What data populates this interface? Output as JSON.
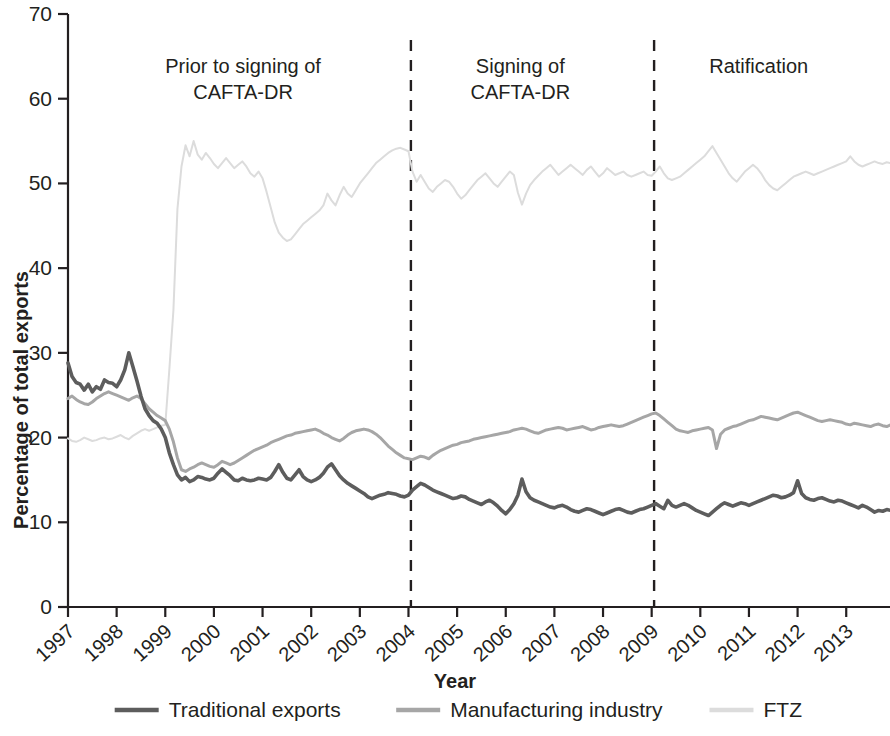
{
  "chart_data": {
    "type": "line",
    "title": "",
    "xlabel": "Year",
    "ylabel": "Percentage of total exports",
    "xlim": [
      1997.0,
      2013.9
    ],
    "ylim": [
      0,
      70
    ],
    "yticks": [
      0,
      10,
      20,
      30,
      40,
      50,
      60,
      70
    ],
    "xticks": [
      1997,
      1998,
      1999,
      2000,
      2001,
      2002,
      2003,
      2004,
      2005,
      2006,
      2007,
      2008,
      2009,
      2010,
      2011,
      2012,
      2013
    ],
    "grid": false,
    "legend_position": "bottom",
    "annotations": [
      {
        "name": "prior-to-signing",
        "lines": [
          "Prior to signing of",
          "CAFTA-DR"
        ],
        "x": 2000.6,
        "y": 63
      },
      {
        "name": "signing",
        "lines": [
          "Signing of",
          "CAFTA-DR"
        ],
        "x": 2006.3,
        "y": 63
      },
      {
        "name": "ratification",
        "lines": [
          "Ratification"
        ],
        "x": 2011.2,
        "y": 63
      }
    ],
    "vertical_dividers": [
      {
        "name": "signing-divider",
        "x": 2004.05,
        "label": "Signing of CAFTA-DR"
      },
      {
        "name": "ratification-divider",
        "x": 2009.05,
        "label": "Ratification"
      }
    ],
    "colors": {
      "traditional": "#5d5d5d",
      "manufacturing": "#a6a6a6",
      "ftz": "#dcdcdc",
      "axis": "#231f20"
    },
    "x": [
      1997.0,
      1997.083,
      1997.167,
      1997.25,
      1997.333,
      1997.417,
      1997.5,
      1997.583,
      1997.667,
      1997.75,
      1997.833,
      1997.917,
      1998.0,
      1998.083,
      1998.167,
      1998.25,
      1998.333,
      1998.417,
      1998.5,
      1998.583,
      1998.667,
      1998.75,
      1998.833,
      1998.917,
      1999.0,
      1999.083,
      1999.167,
      1999.25,
      1999.333,
      1999.417,
      1999.5,
      1999.583,
      1999.667,
      1999.75,
      1999.833,
      1999.917,
      2000.0,
      2000.083,
      2000.167,
      2000.25,
      2000.333,
      2000.417,
      2000.5,
      2000.583,
      2000.667,
      2000.75,
      2000.833,
      2000.917,
      2001.0,
      2001.083,
      2001.167,
      2001.25,
      2001.333,
      2001.417,
      2001.5,
      2001.583,
      2001.667,
      2001.75,
      2001.833,
      2001.917,
      2002.0,
      2002.083,
      2002.167,
      2002.25,
      2002.333,
      2002.417,
      2002.5,
      2002.583,
      2002.667,
      2002.75,
      2002.833,
      2002.917,
      2003.0,
      2003.083,
      2003.167,
      2003.25,
      2003.333,
      2003.417,
      2003.5,
      2003.583,
      2003.667,
      2003.75,
      2003.833,
      2003.917,
      2004.0,
      2004.083,
      2004.167,
      2004.25,
      2004.333,
      2004.417,
      2004.5,
      2004.583,
      2004.667,
      2004.75,
      2004.833,
      2004.917,
      2005.0,
      2005.083,
      2005.167,
      2005.25,
      2005.333,
      2005.417,
      2005.5,
      2005.583,
      2005.667,
      2005.75,
      2005.833,
      2005.917,
      2006.0,
      2006.083,
      2006.167,
      2006.25,
      2006.333,
      2006.417,
      2006.5,
      2006.583,
      2006.667,
      2006.75,
      2006.833,
      2006.917,
      2007.0,
      2007.083,
      2007.167,
      2007.25,
      2007.333,
      2007.417,
      2007.5,
      2007.583,
      2007.667,
      2007.75,
      2007.833,
      2007.917,
      2008.0,
      2008.083,
      2008.167,
      2008.25,
      2008.333,
      2008.417,
      2008.5,
      2008.583,
      2008.667,
      2008.75,
      2008.833,
      2008.917,
      2009.0,
      2009.083,
      2009.167,
      2009.25,
      2009.333,
      2009.417,
      2009.5,
      2009.583,
      2009.667,
      2009.75,
      2009.833,
      2009.917,
      2010.0,
      2010.083,
      2010.167,
      2010.25,
      2010.333,
      2010.417,
      2010.5,
      2010.583,
      2010.667,
      2010.75,
      2010.833,
      2010.917,
      2011.0,
      2011.083,
      2011.167,
      2011.25,
      2011.333,
      2011.417,
      2011.5,
      2011.583,
      2011.667,
      2011.75,
      2011.833,
      2011.917,
      2012.0,
      2012.083,
      2012.167,
      2012.25,
      2012.333,
      2012.417,
      2012.5,
      2012.583,
      2012.667,
      2012.75,
      2012.833,
      2012.917,
      2013.0,
      2013.083,
      2013.167,
      2013.25,
      2013.333,
      2013.417,
      2013.5,
      2013.583,
      2013.667,
      2013.75,
      2013.833,
      2013.917
    ],
    "series": [
      {
        "name": "Traditional exports",
        "color": "#5d5d5d",
        "values": [
          28.8,
          27.2,
          26.5,
          26.3,
          25.6,
          26.3,
          25.4,
          26.0,
          25.7,
          26.8,
          26.5,
          26.4,
          26.0,
          26.8,
          28.0,
          30.0,
          28.4,
          26.7,
          24.9,
          23.4,
          22.6,
          22.0,
          21.7,
          21.0,
          20.0,
          18.2,
          16.8,
          15.6,
          15.0,
          15.3,
          14.8,
          15.0,
          15.4,
          15.3,
          15.1,
          15.0,
          15.2,
          15.8,
          16.3,
          15.9,
          15.5,
          15.0,
          14.9,
          15.2,
          15.0,
          14.9,
          15.0,
          15.2,
          15.1,
          15.0,
          15.3,
          16.0,
          16.8,
          15.9,
          15.2,
          15.0,
          15.6,
          16.2,
          15.4,
          15.0,
          14.8,
          15.0,
          15.3,
          15.8,
          16.5,
          16.9,
          16.2,
          15.5,
          15.0,
          14.6,
          14.3,
          14.0,
          13.7,
          13.4,
          13.0,
          12.8,
          13.0,
          13.2,
          13.3,
          13.5,
          13.4,
          13.3,
          13.1,
          13.0,
          13.2,
          13.8,
          14.2,
          14.6,
          14.4,
          14.1,
          13.8,
          13.6,
          13.4,
          13.2,
          13.0,
          12.8,
          12.9,
          13.1,
          13.0,
          12.7,
          12.5,
          12.3,
          12.1,
          12.4,
          12.6,
          12.3,
          11.9,
          11.4,
          11.0,
          11.5,
          12.2,
          13.2,
          15.1,
          13.6,
          12.9,
          12.6,
          12.4,
          12.2,
          12.0,
          11.8,
          11.7,
          11.9,
          12.0,
          11.8,
          11.5,
          11.3,
          11.2,
          11.4,
          11.6,
          11.5,
          11.3,
          11.1,
          10.9,
          11.1,
          11.3,
          11.5,
          11.6,
          11.4,
          11.2,
          11.1,
          11.3,
          11.5,
          11.6,
          11.8,
          12.0,
          12.2,
          11.9,
          11.6,
          12.6,
          12.0,
          11.8,
          12.0,
          12.2,
          12.0,
          11.7,
          11.4,
          11.2,
          11.0,
          10.8,
          11.2,
          11.6,
          12.0,
          12.3,
          12.1,
          11.9,
          12.1,
          12.3,
          12.2,
          12.0,
          12.2,
          12.4,
          12.6,
          12.8,
          13.0,
          13.2,
          13.1,
          12.9,
          13.0,
          13.2,
          13.5,
          14.9,
          13.4,
          12.9,
          12.7,
          12.6,
          12.8,
          12.9,
          12.7,
          12.5,
          12.4,
          12.6,
          12.5,
          12.3,
          12.1,
          11.9,
          11.7,
          12.0,
          11.8,
          11.5,
          11.2,
          11.4,
          11.3,
          11.5,
          11.4
        ]
      },
      {
        "name": "Manufacturing industry",
        "color": "#a6a6a6",
        "values": [
          24.6,
          24.9,
          24.5,
          24.2,
          24.0,
          23.9,
          24.2,
          24.6,
          24.9,
          25.2,
          25.4,
          25.2,
          25.0,
          24.8,
          24.6,
          24.4,
          24.7,
          24.9,
          24.6,
          24.0,
          23.4,
          23.0,
          22.6,
          22.3,
          22.0,
          21.0,
          19.5,
          17.6,
          16.2,
          16.0,
          16.3,
          16.5,
          16.8,
          17.0,
          16.8,
          16.6,
          16.5,
          16.8,
          17.2,
          17.0,
          16.8,
          17.0,
          17.3,
          17.6,
          17.9,
          18.2,
          18.5,
          18.7,
          18.9,
          19.1,
          19.4,
          19.6,
          19.8,
          20.0,
          20.2,
          20.3,
          20.5,
          20.6,
          20.7,
          20.8,
          20.9,
          21.0,
          20.8,
          20.5,
          20.3,
          20.0,
          19.8,
          19.6,
          19.9,
          20.3,
          20.6,
          20.8,
          20.9,
          21.0,
          20.9,
          20.7,
          20.4,
          20.0,
          19.5,
          19.0,
          18.6,
          18.2,
          17.9,
          17.6,
          17.5,
          17.4,
          17.6,
          17.8,
          17.7,
          17.5,
          17.9,
          18.2,
          18.5,
          18.7,
          18.9,
          19.1,
          19.2,
          19.4,
          19.5,
          19.6,
          19.8,
          19.9,
          20.0,
          20.1,
          20.2,
          20.3,
          20.4,
          20.5,
          20.6,
          20.7,
          20.9,
          21.0,
          21.1,
          21.0,
          20.8,
          20.6,
          20.5,
          20.7,
          20.9,
          21.0,
          21.1,
          21.2,
          21.1,
          20.9,
          21.0,
          21.1,
          21.2,
          21.3,
          21.1,
          20.9,
          21.0,
          21.2,
          21.3,
          21.4,
          21.5,
          21.4,
          21.3,
          21.4,
          21.6,
          21.8,
          22.0,
          22.2,
          22.4,
          22.6,
          22.8,
          22.9,
          22.6,
          22.2,
          21.8,
          21.4,
          21.0,
          20.8,
          20.7,
          20.6,
          20.8,
          20.9,
          21.0,
          21.1,
          21.2,
          20.9,
          18.7,
          20.4,
          20.9,
          21.1,
          21.3,
          21.4,
          21.6,
          21.8,
          22.0,
          22.1,
          22.3,
          22.5,
          22.4,
          22.3,
          22.2,
          22.1,
          22.3,
          22.5,
          22.7,
          22.9,
          23.0,
          22.8,
          22.6,
          22.4,
          22.2,
          22.0,
          21.9,
          22.0,
          22.1,
          22.0,
          21.9,
          21.8,
          21.6,
          21.5,
          21.7,
          21.6,
          21.5,
          21.4,
          21.3,
          21.5,
          21.6,
          21.4,
          21.3,
          21.5
        ]
      },
      {
        "name": "FTZ",
        "color": "#dcdcdc",
        "values": [
          19.9,
          19.6,
          19.5,
          19.7,
          20.0,
          19.8,
          19.6,
          19.7,
          19.9,
          20.0,
          19.8,
          19.9,
          20.1,
          20.3,
          20.0,
          19.8,
          20.2,
          20.5,
          20.8,
          21.0,
          20.8,
          21.0,
          21.2,
          21.4,
          21.5,
          28.0,
          35.0,
          47.0,
          52.0,
          54.5,
          53.2,
          55.0,
          53.4,
          52.8,
          53.6,
          53.0,
          52.3,
          51.8,
          52.4,
          53.0,
          52.4,
          51.8,
          52.2,
          52.6,
          52.0,
          51.2,
          50.8,
          51.4,
          50.6,
          49.0,
          47.2,
          45.4,
          44.2,
          43.6,
          43.2,
          43.4,
          44.0,
          44.6,
          45.2,
          45.6,
          46.0,
          46.4,
          46.8,
          47.4,
          48.8,
          48.0,
          47.4,
          48.6,
          49.6,
          48.8,
          48.4,
          49.2,
          50.0,
          50.6,
          51.2,
          51.8,
          52.4,
          52.8,
          53.2,
          53.6,
          53.9,
          54.1,
          54.2,
          54.0,
          53.8,
          51.4,
          50.2,
          51.0,
          50.2,
          49.4,
          49.0,
          49.6,
          50.0,
          50.4,
          50.2,
          49.6,
          48.8,
          48.2,
          48.6,
          49.2,
          49.8,
          50.4,
          50.8,
          51.2,
          50.6,
          50.0,
          49.6,
          50.2,
          50.8,
          51.4,
          51.0,
          48.9,
          47.5,
          48.8,
          49.8,
          50.4,
          50.9,
          51.4,
          51.8,
          52.2,
          51.6,
          51.0,
          51.4,
          51.8,
          52.2,
          51.8,
          51.4,
          51.0,
          51.6,
          52.0,
          51.4,
          50.8,
          51.2,
          51.8,
          51.4,
          51.0,
          51.2,
          51.4,
          51.0,
          50.8,
          51.0,
          51.2,
          51.4,
          51.0,
          50.9,
          51.4,
          52.0,
          51.2,
          50.6,
          50.4,
          50.6,
          50.8,
          51.2,
          51.6,
          52.0,
          52.4,
          52.8,
          53.2,
          53.8,
          54.4,
          53.6,
          52.8,
          52.0,
          51.2,
          50.6,
          50.2,
          50.8,
          51.4,
          51.8,
          52.2,
          51.8,
          51.2,
          50.4,
          49.8,
          49.4,
          49.2,
          49.6,
          50.0,
          50.4,
          50.8,
          51.0,
          51.2,
          51.4,
          51.2,
          51.0,
          51.2,
          51.4,
          51.6,
          51.8,
          52.0,
          52.2,
          52.4,
          52.6,
          53.2,
          52.6,
          52.2,
          52.0,
          52.2,
          52.4,
          52.6,
          52.4,
          52.3,
          52.5,
          52.4
        ]
      }
    ]
  },
  "legend": {
    "items": [
      {
        "label": "Traditional exports",
        "color": "#5d5d5d"
      },
      {
        "label": "Manufacturing industry",
        "color": "#a6a6a6"
      },
      {
        "label": "FTZ",
        "color": "#dcdcdc"
      }
    ]
  },
  "axes": {
    "x_title": "Year",
    "y_title": "Percentage of total exports",
    "y_tick_labels": [
      "0",
      "10",
      "20",
      "30",
      "40",
      "50",
      "60",
      "70"
    ],
    "x_tick_labels": [
      "1997",
      "1998",
      "1999",
      "2000",
      "2001",
      "2002",
      "2003",
      "2004",
      "2005",
      "2006",
      "2007",
      "2008",
      "2009",
      "2010",
      "2011",
      "2012",
      "2013"
    ]
  },
  "annotations": {
    "prior_line1": "Prior to signing of",
    "prior_line2": "CAFTA-DR",
    "signing_line1": "Signing of",
    "signing_line2": "CAFTA-DR",
    "ratification_line1": "Ratification"
  }
}
